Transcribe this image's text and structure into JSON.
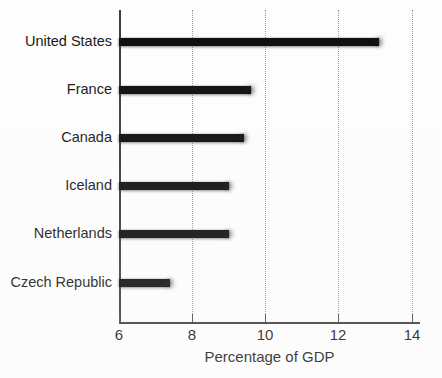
{
  "chart_data": {
    "type": "bar",
    "orientation": "horizontal",
    "title": "",
    "subtitle": "",
    "xlabel": "Percentage of GDP",
    "ylabel": "",
    "categories": [
      "United States",
      "France",
      "Canada",
      "Iceland",
      "Netherlands",
      "Czech Republic"
    ],
    "values": [
      13.1,
      9.6,
      9.4,
      9.0,
      9.0,
      7.4
    ],
    "xlim": [
      6,
      14
    ],
    "xticks": [
      6,
      8,
      10,
      12,
      14
    ],
    "xtick_labels": [
      "6",
      "8",
      "10",
      "12",
      "14"
    ],
    "gridlines": {
      "vertical_at": [
        8,
        10,
        12,
        14
      ],
      "style": "dotted",
      "horizontal": false
    },
    "legend": {
      "visible": false,
      "position": "none",
      "entries": []
    },
    "series": [
      {
        "name": "Percentage of GDP",
        "color": "#0b0b0b",
        "values": [
          13.1,
          9.6,
          9.4,
          9.0,
          9.0,
          7.4
        ]
      }
    ],
    "annotations": [],
    "bar_color": "#0b0b0b",
    "background_color": "#ffffff",
    "axis_color": "#3a3a3a"
  }
}
